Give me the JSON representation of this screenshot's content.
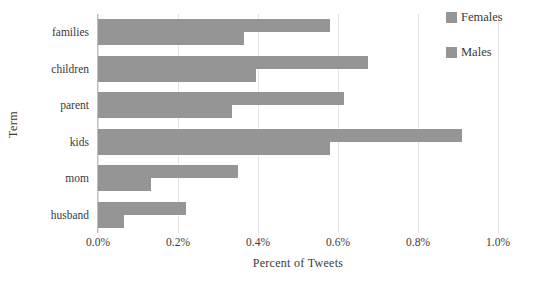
{
  "chart_data": {
    "type": "bar",
    "orientation": "horizontal",
    "title": "",
    "xlabel": "Percent of Tweets",
    "ylabel": "Term",
    "categories": [
      "families",
      "children",
      "parent",
      "kids",
      "mom",
      "husband"
    ],
    "series": [
      {
        "name": "Females",
        "values": [
          0.58,
          0.675,
          0.615,
          0.91,
          0.35,
          0.22
        ]
      },
      {
        "name": "Males",
        "values": [
          0.365,
          0.395,
          0.335,
          0.58,
          0.133,
          0.065
        ]
      }
    ],
    "xlim": [
      0.0,
      1.0
    ],
    "xtick_values": [
      0.0,
      0.2,
      0.4,
      0.6,
      0.8,
      1.0
    ],
    "xtick_labels": [
      "0.0%",
      "0.2%",
      "0.4%",
      "0.6%",
      "0.8%",
      "1.0%"
    ],
    "grid": "vertical",
    "legend_position": "top-right",
    "value_unit": "%",
    "bar_color": "#959595",
    "gridline_color": "#e4e4e4",
    "axis_color": "#bdbdbd",
    "text_color": "#3a3a3a",
    "background": "#ffffff"
  },
  "legend": {
    "entries": [
      {
        "label": "Females",
        "color": "#959595",
        "swatch": "legend-swatch-females"
      },
      {
        "label": "Males",
        "color": "#959595",
        "swatch": "legend-swatch-males"
      }
    ]
  }
}
